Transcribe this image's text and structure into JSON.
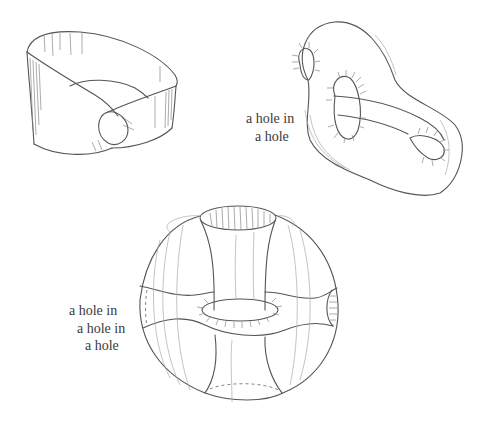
{
  "figures": [
    {
      "id": "mobius-band",
      "caption": ""
    },
    {
      "id": "knotted-torus",
      "caption_lines": [
        "a hole in",
        "a hole"
      ]
    },
    {
      "id": "nested-torus-sphere",
      "caption_lines": [
        "a hole in",
        "a hole in",
        "a hole"
      ]
    }
  ],
  "colors": {
    "background": "#ffffff",
    "ink": "#555555",
    "text": "#3a3a3a"
  }
}
